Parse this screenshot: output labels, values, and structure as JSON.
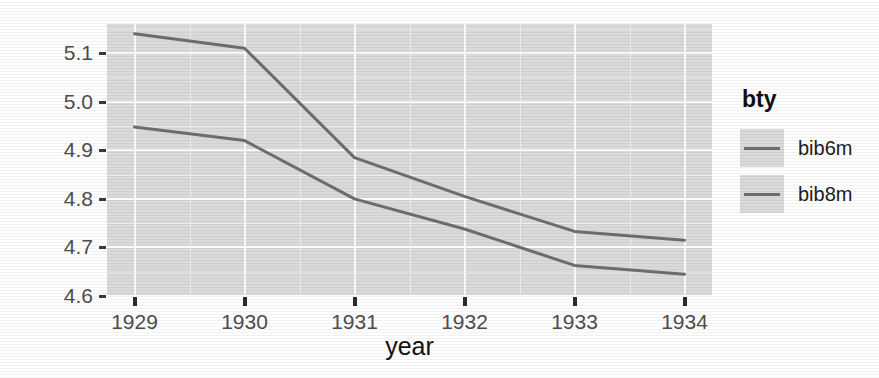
{
  "chart_data": {
    "type": "line",
    "title": "",
    "xlabel": "year",
    "ylabel": "log (num)",
    "x": [
      1929,
      1930,
      1931,
      1932,
      1933,
      1934
    ],
    "xtick_labels": [
      "1929",
      "1930",
      "1931",
      "1932",
      "1933",
      "1934"
    ],
    "ytick_labels": [
      "5.1",
      "5.0",
      "4.9",
      "4.8",
      "4.7",
      "4.6"
    ],
    "ytick_values": [
      5.1,
      5.0,
      4.9,
      4.8,
      4.7,
      4.6
    ],
    "xlim": [
      1928.75,
      1934.25
    ],
    "ylim": [
      4.6,
      5.16
    ],
    "grid": true,
    "legend_position": "right",
    "legend_title": "bty",
    "series": [
      {
        "name": "bib6m",
        "color": "#6e6e6e",
        "values": [
          4.948,
          4.92,
          4.8,
          4.738,
          4.663,
          4.645
        ]
      },
      {
        "name": "bib8m",
        "color": "#6e6e6e",
        "values": [
          5.14,
          5.11,
          4.885,
          4.805,
          4.733,
          4.715
        ]
      }
    ]
  },
  "panel": {
    "background_color": "#dadada",
    "gridline_color": "#fbfbfb"
  },
  "axes": {
    "x_title": "year",
    "y_title": "log (num)"
  },
  "legend": {
    "title": "bty",
    "items": [
      {
        "label": "bib6m"
      },
      {
        "label": "bib8m"
      }
    ]
  }
}
